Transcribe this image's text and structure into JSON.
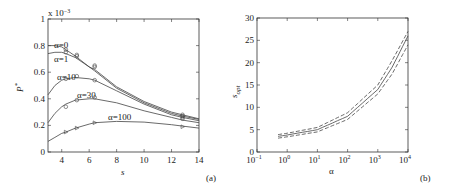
{
  "chart_data": [
    {
      "panel": "(a)",
      "type": "line",
      "title": "",
      "xlabel": "s",
      "ylabel": "P*",
      "y_multiplier": "x 10^-3",
      "xlim": [
        3,
        14
      ],
      "ylim": [
        0,
        1
      ],
      "xticks": [
        4,
        6,
        8,
        10,
        12,
        14
      ],
      "yticks": [
        0,
        0.2,
        0.4,
        0.6,
        0.8,
        1
      ],
      "grid": false,
      "legend": "inline labels",
      "series": [
        {
          "name": "α=0",
          "marker": "circle",
          "x": [
            3,
            3.5,
            4,
            4.3,
            5,
            6,
            6.4,
            8,
            10,
            12,
            12.8,
            14
          ],
          "y": [
            0.8,
            0.8,
            0.79,
            0.77,
            0.72,
            0.64,
            0.62,
            0.49,
            0.38,
            0.3,
            0.28,
            0.25
          ],
          "markers_x": [
            4.3,
            5.1,
            6.4,
            12.8
          ],
          "markers_y": [
            0.77,
            0.73,
            0.65,
            0.28
          ]
        },
        {
          "name": "α=1",
          "marker": "circle",
          "x": [
            3,
            3.5,
            4,
            4.3,
            5,
            6,
            6.4,
            8,
            10,
            12,
            12.8,
            14
          ],
          "y": [
            0.74,
            0.75,
            0.75,
            0.74,
            0.71,
            0.64,
            0.61,
            0.48,
            0.37,
            0.29,
            0.27,
            0.245
          ],
          "markers_x": [
            4.3,
            5.1,
            6.4,
            12.8
          ],
          "markers_y": [
            0.75,
            0.72,
            0.64,
            0.27
          ]
        },
        {
          "name": "α=10",
          "marker": "circle",
          "x": [
            3,
            3.5,
            4,
            4.3,
            5,
            6,
            6.4,
            8,
            10,
            12,
            12.8,
            14
          ],
          "y": [
            0.43,
            0.5,
            0.54,
            0.55,
            0.56,
            0.55,
            0.54,
            0.46,
            0.36,
            0.28,
            0.26,
            0.235
          ],
          "markers_x": [
            4.3,
            5.1,
            6.4,
            12.8
          ],
          "markers_y": [
            0.55,
            0.57,
            0.54,
            0.26
          ]
        },
        {
          "name": "α=30",
          "marker": "circle",
          "x": [
            3,
            3.5,
            4,
            4.3,
            5,
            6,
            6.4,
            8,
            10,
            12,
            12.8,
            14
          ],
          "y": [
            0.22,
            0.29,
            0.34,
            0.36,
            0.39,
            0.4,
            0.4,
            0.37,
            0.31,
            0.26,
            0.24,
            0.22
          ],
          "markers_x": [
            4.3,
            5.1,
            6.4,
            12.8
          ],
          "markers_y": [
            0.34,
            0.39,
            0.41,
            0.25
          ]
        },
        {
          "name": "α=100",
          "marker": "triangle-right",
          "x": [
            3,
            3.5,
            4,
            4.3,
            5,
            6,
            6.4,
            8,
            10,
            12,
            12.8,
            14
          ],
          "y": [
            0.08,
            0.11,
            0.14,
            0.15,
            0.18,
            0.21,
            0.22,
            0.23,
            0.225,
            0.205,
            0.195,
            0.18
          ],
          "markers_x": [
            4.3,
            5.1,
            6.4,
            12.8
          ],
          "markers_y": [
            0.15,
            0.18,
            0.22,
            0.19
          ]
        }
      ],
      "annotations": [
        "α=0",
        "α=1",
        "α=10",
        "α=30",
        "α=100"
      ]
    },
    {
      "panel": "(b)",
      "type": "line",
      "title": "",
      "xlabel": "α",
      "ylabel": "s_opt",
      "xscale": "log",
      "xlim": [
        0.1,
        10000
      ],
      "ylim": [
        0,
        30
      ],
      "xticks": [
        "10^-1",
        "10^0",
        "10^1",
        "10^2",
        "10^3",
        "10^4"
      ],
      "yticks": [
        0,
        5,
        10,
        15,
        20,
        25,
        30
      ],
      "grid": false,
      "series": [
        {
          "name": "s_opt",
          "style": "solid",
          "x": [
            0.5,
            1,
            10,
            100,
            1000,
            3000,
            10000
          ],
          "y": [
            3.5,
            3.8,
            5.0,
            8.0,
            14.0,
            19.0,
            26.0
          ]
        },
        {
          "name": "upper bound",
          "style": "dashed",
          "x": [
            0.5,
            1,
            10,
            100,
            1000,
            3000,
            10000
          ],
          "y": [
            3.9,
            4.2,
            5.5,
            8.8,
            15.0,
            20.5,
            27.0
          ]
        },
        {
          "name": "lower bound",
          "style": "dashed",
          "x": [
            0.5,
            1,
            10,
            100,
            1000,
            3000,
            10000
          ],
          "y": [
            3.1,
            3.4,
            4.5,
            7.3,
            13.0,
            17.5,
            24.0
          ]
        }
      ]
    }
  ],
  "labels": {
    "a": {
      "multiplier": "x 10",
      "multiplier_exp": "−3",
      "ylabel": "P",
      "ylabel_sup": "*",
      "xlabel": "s",
      "panel": "(a)",
      "yticks": [
        "0",
        "0.2",
        "0.4",
        "0.6",
        "0.8",
        "1"
      ],
      "xticks": [
        "4",
        "6",
        "8",
        "10",
        "12",
        "14"
      ],
      "series": [
        "α=0",
        "α=1",
        "α=10",
        "α=30",
        "α=100"
      ]
    },
    "b": {
      "ylabel": "s",
      "ylabel_sub": "opt",
      "xlabel": "α",
      "panel": "(b)",
      "yticks": [
        "0",
        "5",
        "10",
        "15",
        "20",
        "25",
        "30"
      ],
      "xtick_base": "10",
      "xtick_exps": [
        "−1",
        "0",
        "1",
        "2",
        "3",
        "4"
      ]
    }
  }
}
